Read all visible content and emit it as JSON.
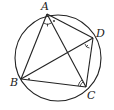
{
  "diagram": {
    "type": "cyclic-quadrilateral",
    "circle": {
      "cx": 58,
      "cy": 58,
      "r": 43
    },
    "points": {
      "A": {
        "label": "A",
        "x": 47,
        "y": 14
      },
      "B": {
        "label": "B",
        "x": 21,
        "y": 79
      },
      "C": {
        "label": "C",
        "x": 86,
        "y": 87
      },
      "D": {
        "label": "D",
        "x": 93,
        "y": 38
      }
    },
    "segments": [
      "AB",
      "BC",
      "CD",
      "DA",
      "AC",
      "BD"
    ],
    "angle_marks": [
      "BAC (single arc with tick)",
      "CAD (dot)",
      "ADB (single arc with tick)",
      "DBC (dot)",
      "ACB (double arc)"
    ],
    "stroke_color": "#222222"
  }
}
